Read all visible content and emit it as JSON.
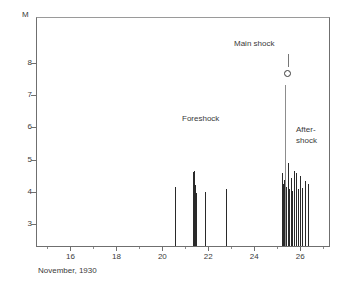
{
  "figure": {
    "x_axis_title": "November, 1930",
    "y_axis_unit": "M"
  },
  "annotations": {
    "foreshock": "Foreshock",
    "mainshock": "Main shock",
    "aftershock_line1": "After-",
    "aftershock_line2": "shock"
  },
  "colors": {
    "spike": "#2a2a2a",
    "axis": "#6f6f6f",
    "text": "#3a3a3a",
    "background": "#ffffff"
  },
  "chart_data": {
    "type": "bar",
    "title": "",
    "subtitle": "",
    "xlabel": "November, 1930",
    "ylabel": "M",
    "xlim": [
      14.5,
      27.3
    ],
    "ylim": [
      2.28,
      9.43
    ],
    "grid": false,
    "legend": null,
    "x_ticks": [
      16,
      18,
      20,
      22,
      24,
      26
    ],
    "x_tick_labels": [
      "16",
      "18",
      "20",
      "22",
      "24",
      "26"
    ],
    "y_ticks": [
      3,
      4,
      5,
      6,
      7,
      8
    ],
    "y_tick_labels": [
      "3",
      "4",
      "5",
      "6",
      "7",
      "8"
    ],
    "series_name": "Earthquake magnitude",
    "x_unit": "day of November 1930",
    "y_unit": "magnitude M",
    "points": [
      {
        "day": 20.52,
        "magnitude": 4.1
      },
      {
        "day": 21.28,
        "magnitude": 4.58
      },
      {
        "day": 21.33,
        "magnitude": 4.62
      },
      {
        "day": 21.38,
        "magnitude": 4.18
      },
      {
        "day": 21.44,
        "magnitude": 3.92
      },
      {
        "day": 21.8,
        "magnitude": 3.95
      },
      {
        "day": 22.72,
        "magnitude": 4.05
      },
      {
        "day": 25.15,
        "magnitude": 4.55
      },
      {
        "day": 25.2,
        "magnitude": 4.2
      },
      {
        "day": 25.25,
        "magnitude": 4.32
      },
      {
        "day": 25.3,
        "magnitude": 7.3
      },
      {
        "day": 25.36,
        "magnitude": 4.1
      },
      {
        "day": 25.42,
        "magnitude": 4.85
      },
      {
        "day": 25.48,
        "magnitude": 4.05
      },
      {
        "day": 25.55,
        "magnitude": 4.4
      },
      {
        "day": 25.62,
        "magnitude": 3.98
      },
      {
        "day": 25.7,
        "magnitude": 4.62
      },
      {
        "day": 25.78,
        "magnitude": 4.55
      },
      {
        "day": 25.86,
        "magnitude": 4.05
      },
      {
        "day": 25.95,
        "magnitude": 4.45
      },
      {
        "day": 26.05,
        "magnitude": 4.08
      },
      {
        "day": 26.18,
        "magnitude": 4.3
      },
      {
        "day": 26.3,
        "magnitude": 4.22
      }
    ],
    "markers": [
      {
        "day": 25.3,
        "magnitude": 7.3,
        "shape": "circle",
        "label": "Main shock"
      }
    ],
    "text_annotations": [
      {
        "text": "Foreshock",
        "day": 21.5,
        "magnitude": 5.55
      },
      {
        "text": "Main shock",
        "day": 23.9,
        "magnitude": 7.95
      },
      {
        "text": "After-shock",
        "day": 26.6,
        "magnitude": 5.25
      }
    ]
  }
}
